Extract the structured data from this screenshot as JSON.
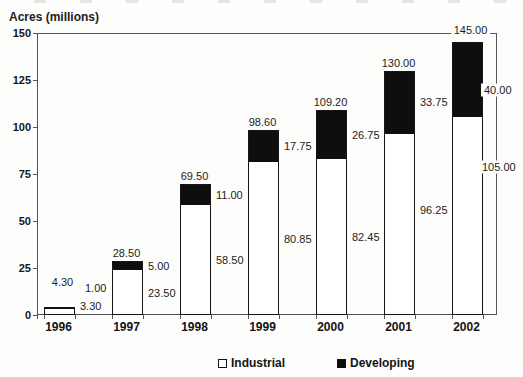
{
  "header": {
    "axis_title": "Acres (millions)"
  },
  "legend": {
    "items": [
      {
        "label": "Industrial",
        "swatch": "white"
      },
      {
        "label": "Developing",
        "swatch": "black"
      }
    ]
  },
  "colors": {
    "industrial_fill": "#ffffff",
    "developing_fill": "#0e0e0e",
    "bar_border": "#161616",
    "frame_line": "#555555",
    "text": "#1c1c1c"
  },
  "chart_data": {
    "type": "bar",
    "stacked": true,
    "title": "",
    "ylabel": "Acres (millions)",
    "xlabel": "",
    "categories": [
      "1996",
      "1997",
      "1998",
      "1999",
      "2000",
      "2001",
      "2002"
    ],
    "series": [
      {
        "name": "Industrial",
        "color": "#ffffff",
        "values": [
          3.3,
          23.5,
          58.5,
          80.85,
          82.45,
          96.25,
          105.0
        ]
      },
      {
        "name": "Developing",
        "color": "#0e0e0e",
        "values": [
          1.0,
          5.0,
          11.0,
          17.75,
          26.75,
          33.75,
          40.0
        ]
      }
    ],
    "totals": [
      4.3,
      28.5,
      69.5,
      98.6,
      109.2,
      130.0,
      145.0
    ],
    "labels": {
      "totals": [
        "4.30",
        "28.50",
        "69.50",
        "98.60",
        "109.20",
        "130.00",
        "145.00"
      ],
      "developing": [
        "1.00",
        "5.00",
        "11.00",
        "17.75",
        "26.75",
        "33.75",
        "40.00"
      ],
      "industrial": [
        "3.30",
        "23.50",
        "58.50",
        "80.85",
        "82.45",
        "96.25",
        "105.00"
      ]
    },
    "yticks": [
      "0",
      "25",
      "50",
      "75",
      "100",
      "125",
      "150"
    ],
    "ytick_values": [
      0,
      25,
      50,
      75,
      100,
      125,
      150
    ],
    "ylim": [
      0,
      150
    ],
    "grid": false,
    "frame": "closed-box",
    "legend_position": "bottom"
  }
}
